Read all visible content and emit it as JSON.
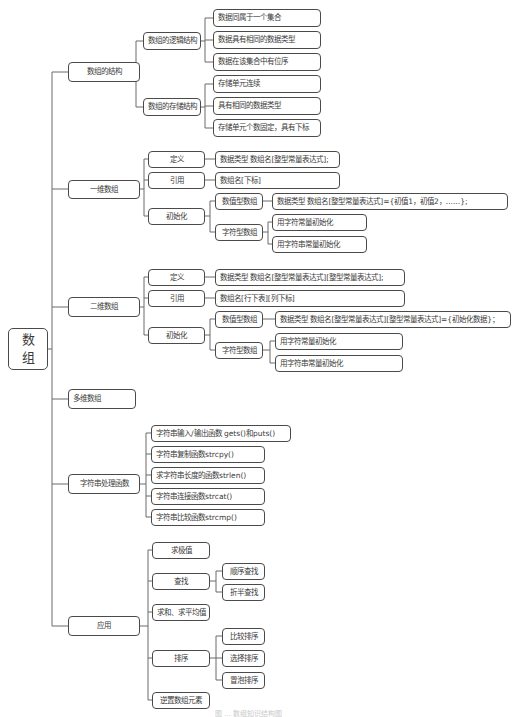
{
  "diagram": {
    "type": "mind-map",
    "root": {
      "label_line1": "数",
      "label_line2": "组"
    },
    "branches": {
      "structure": {
        "label": "数组的结构",
        "logical": {
          "label": "数组的逻辑结构",
          "items": [
            "数据同属于一个集合",
            "数据具有相同的数据类型",
            "数据在该集合中有位序"
          ]
        },
        "storage": {
          "label": "数组的存储结构",
          "items": [
            "存储单元连续",
            "具有相同的数据类型",
            "存储单元个数固定，具有下标"
          ]
        }
      },
      "one_dim": {
        "label": "一维数组",
        "define": {
          "label": "定义",
          "value": "数据类型 数组名[整型常量表达式];"
        },
        "reference": {
          "label": "引用",
          "value": "数组名[下标]"
        },
        "init": {
          "label": "初始化",
          "numeric": {
            "label": "数值型数组",
            "value": "数据类型 数组名[整型常量表达式]={初值1，初值2，......};"
          },
          "char": {
            "label": "字符型数组",
            "items": [
              "用字符常量初始化",
              "用字符串常量初始化"
            ]
          }
        }
      },
      "two_dim": {
        "label": "二维数组",
        "define": {
          "label": "定义",
          "value": "数据类型 数组名[整型常量表达式][整型常量表达式];"
        },
        "reference": {
          "label": "引用",
          "value": "数组名[行下表][列下标]"
        },
        "init": {
          "label": "初始化",
          "numeric": {
            "label": "数值型数组",
            "value": "数据类型 数组名[整型常量表达式][整型常量表达式]={初始化数据}；"
          },
          "char": {
            "label": "字符型数组",
            "items": [
              "用字符常量初始化",
              "用字符串常量初始化"
            ]
          }
        }
      },
      "multi_dim": {
        "label": "多维数组"
      },
      "string_funcs": {
        "label": "字符串处理函数",
        "items": [
          "字符串输入/输出函数 gets()和puts()",
          "字符串复制函数strcpy()",
          "求字符串长度的函数strlen()",
          "字符串连接函数strcat()",
          "字符串比较函数strcmp()"
        ]
      },
      "application": {
        "label": "应用",
        "extreme": {
          "label": "求极值"
        },
        "search": {
          "label": "查找",
          "items": [
            "顺序查找",
            "折半查找"
          ]
        },
        "sum_avg": {
          "label": "求和、求平均值"
        },
        "sort": {
          "label": "排序",
          "items": [
            "比较排序",
            "选择排序",
            "冒泡排序"
          ]
        },
        "reverse": {
          "label": "逆置数组元素"
        }
      }
    }
  },
  "caption": "图 ... 数组知识结构图"
}
